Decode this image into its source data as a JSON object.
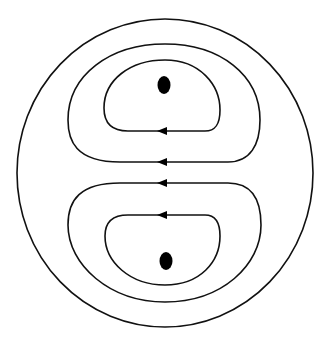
{
  "diagram": {
    "type": "flow-field",
    "colors": {
      "background": "#ffffff",
      "line": "#111111",
      "dot": "#000000"
    },
    "outer_boundary": {
      "shape": "circle",
      "cx": 165,
      "cy": 173,
      "rx": 148,
      "ry": 154
    },
    "vortices": [
      {
        "position": "upper",
        "center_dot": {
          "cx": 164,
          "cy": 85
        },
        "streamlines": 2,
        "arrow_direction": "left"
      },
      {
        "position": "lower",
        "center_dot": {
          "cx": 166,
          "cy": 261
        },
        "streamlines": 2,
        "arrow_direction": "left"
      }
    ],
    "arrows": [
      {
        "x": 162,
        "y": 131,
        "direction": "left"
      },
      {
        "x": 162,
        "y": 162,
        "direction": "left"
      },
      {
        "x": 162,
        "y": 183,
        "direction": "left"
      },
      {
        "x": 162,
        "y": 215,
        "direction": "left"
      }
    ]
  }
}
